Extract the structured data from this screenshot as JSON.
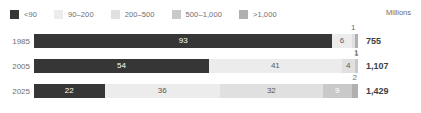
{
  "units_label": "Millions",
  "legend": {
    "items": [
      {
        "label": "<90",
        "color": "#363636"
      },
      {
        "label": "90–200",
        "color": "#ececec"
      },
      {
        "label": "200–500",
        "color": "#e0e0e0"
      },
      {
        "label": "500–1,000",
        "color": "#c9c9c9"
      },
      {
        "label": ">1,000",
        "color": "#b0b0b0"
      }
    ]
  },
  "chart_data": {
    "type": "bar",
    "title": "",
    "subtitle": "",
    "xlabel": "",
    "ylabel": "",
    "unit": "Millions",
    "orientation": "horizontal",
    "stacked": true,
    "normalized_percent": true,
    "grid": false,
    "legend_position": "top-left",
    "xlim": [
      0,
      100
    ],
    "categories": [
      "1985",
      "2005",
      "2025"
    ],
    "series": [
      {
        "name": "<90",
        "color": "#363636",
        "values": [
          93,
          54,
          22
        ]
      },
      {
        "name": "90–200",
        "color": "#ececec",
        "values": [
          6,
          41,
          36
        ]
      },
      {
        "name": "200–500",
        "color": "#e0e0e0",
        "values": [
          1,
          4,
          32
        ]
      },
      {
        "name": "500–1,000",
        "color": "#c9c9c9",
        "values": [
          0,
          1,
          9
        ]
      },
      {
        "name": ">1,000",
        "color": "#b0b0b0",
        "values": [
          1,
          0,
          2
        ]
      }
    ],
    "totals": [
      "755",
      "1,107",
      "1,429"
    ],
    "rows": [
      {
        "year": "1985",
        "total": "755",
        "segments": [
          {
            "label": "93",
            "value": 93,
            "color": "#363636",
            "label_style": "inside-dark",
            "label_pos": "inside"
          },
          {
            "label": "6",
            "value": 6,
            "color": "#ececec",
            "label_style": "inside-light",
            "label_pos": "inside"
          },
          {
            "label": "1",
            "value": 1,
            "color": "#e0e0e0",
            "label_style": "above",
            "label_pos": "above"
          },
          {
            "label": "1",
            "value": 1,
            "color": "#b0b0b0",
            "label_style": "below",
            "label_pos": "below"
          }
        ]
      },
      {
        "year": "2005",
        "total": "1,107",
        "segments": [
          {
            "label": "54",
            "value": 54,
            "color": "#363636",
            "label_style": "inside-dark",
            "label_pos": "inside"
          },
          {
            "label": "41",
            "value": 41,
            "color": "#ececec",
            "label_style": "inside-light",
            "label_pos": "inside"
          },
          {
            "label": "4",
            "value": 4,
            "color": "#e0e0e0",
            "label_style": "inside-light",
            "label_pos": "inside"
          },
          {
            "label": "1",
            "value": 1,
            "color": "#c9c9c9",
            "label_style": "above",
            "label_pos": "above"
          }
        ]
      },
      {
        "year": "2025",
        "total": "1,429",
        "segments": [
          {
            "label": "22",
            "value": 22,
            "color": "#363636",
            "label_style": "inside-dark",
            "label_pos": "inside"
          },
          {
            "label": "36",
            "value": 36,
            "color": "#ececec",
            "label_style": "inside-light",
            "label_pos": "inside"
          },
          {
            "label": "32",
            "value": 32,
            "color": "#e0e0e0",
            "label_style": "inside-light",
            "label_pos": "inside"
          },
          {
            "label": "9",
            "value": 9,
            "color": "#c9c9c9",
            "label_style": "inside-mid",
            "label_pos": "inside"
          },
          {
            "label": "2",
            "value": 2,
            "color": "#b0b0b0",
            "label_style": "above",
            "label_pos": "above"
          }
        ]
      }
    ]
  }
}
